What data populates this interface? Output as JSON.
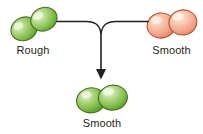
{
  "diagram": {
    "background_color": "#ffffff",
    "arrow": {
      "name": "merge-arrow",
      "color": "#231f20",
      "direction": "down",
      "description": "Two horizontal lines converge into a single downward arrow"
    },
    "nodes": [
      {
        "id": "rough-left",
        "label": "Rough",
        "color": "#7fbb4e",
        "highlight_color": "#d6e9b8",
        "outline_color": "#4e7a2e",
        "shape": "diplococcus-pair",
        "orientation": "tilted",
        "position": "top-left"
      },
      {
        "id": "smooth-right",
        "label": "Smooth",
        "color": "#f2a68a",
        "highlight_color": "#fbdccc",
        "outline_color": "#c4583a",
        "shape": "diplococcus-pair",
        "orientation": "horizontal",
        "position": "top-right"
      },
      {
        "id": "smooth-bottom",
        "label": "Smooth",
        "color": "#7fbb4e",
        "highlight_color": "#d6e9b8",
        "outline_color": "#4e7a2e",
        "shape": "diplococcus-pair",
        "orientation": "horizontal",
        "position": "bottom-center"
      }
    ]
  }
}
